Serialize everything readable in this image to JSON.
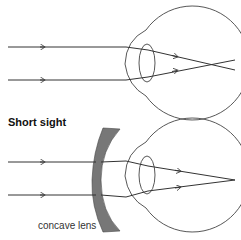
{
  "diagram": {
    "top": {
      "description": "short-sighted eye, rays focus in front of retina"
    },
    "bottom": {
      "title": "Short sight",
      "lens_label": "concave lens",
      "lens_color": "#777777"
    },
    "line_color": "#333333"
  }
}
